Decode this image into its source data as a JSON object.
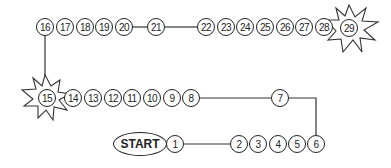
{
  "board": {
    "start_label": "START",
    "spaces": [
      {
        "n": "1",
        "x": 175,
        "y": 144
      },
      {
        "n": "2",
        "x": 239,
        "y": 144
      },
      {
        "n": "3",
        "x": 258,
        "y": 144
      },
      {
        "n": "4",
        "x": 278,
        "y": 144
      },
      {
        "n": "5",
        "x": 297,
        "y": 144
      },
      {
        "n": "6",
        "x": 316,
        "y": 144
      },
      {
        "n": "7",
        "x": 280,
        "y": 98
      },
      {
        "n": "8",
        "x": 191,
        "y": 98
      },
      {
        "n": "9",
        "x": 172,
        "y": 98
      },
      {
        "n": "10",
        "x": 152,
        "y": 98
      },
      {
        "n": "11",
        "x": 132,
        "y": 98
      },
      {
        "n": "12",
        "x": 113,
        "y": 98
      },
      {
        "n": "13",
        "x": 93,
        "y": 98
      },
      {
        "n": "14",
        "x": 73,
        "y": 98
      },
      {
        "n": "15",
        "x": 47,
        "y": 98,
        "special": "star"
      },
      {
        "n": "16",
        "x": 45,
        "y": 27
      },
      {
        "n": "17",
        "x": 65,
        "y": 27
      },
      {
        "n": "18",
        "x": 85,
        "y": 27
      },
      {
        "n": "19",
        "x": 104,
        "y": 27
      },
      {
        "n": "20",
        "x": 124,
        "y": 27
      },
      {
        "n": "21",
        "x": 156,
        "y": 27
      },
      {
        "n": "22",
        "x": 206,
        "y": 27
      },
      {
        "n": "23",
        "x": 226,
        "y": 27
      },
      {
        "n": "24",
        "x": 245,
        "y": 27
      },
      {
        "n": "25",
        "x": 265,
        "y": 27
      },
      {
        "n": "26",
        "x": 285,
        "y": 27
      },
      {
        "n": "27",
        "x": 304,
        "y": 27
      },
      {
        "n": "28",
        "x": 324,
        "y": 27
      },
      {
        "n": "29",
        "x": 349,
        "y": 28,
        "special": "star"
      }
    ],
    "colors": {
      "line": "#222222",
      "background": "#ffffff"
    }
  }
}
